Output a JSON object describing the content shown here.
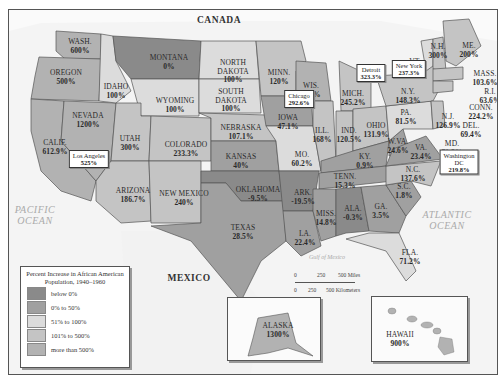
{
  "map": {
    "countries": {
      "canada": "CANADA",
      "mexico": "MEXICO"
    },
    "oceans": {
      "pacific": [
        "PACIFIC",
        "OCEAN"
      ],
      "atlantic": [
        "ATLANTIC",
        "OCEAN"
      ],
      "gulf": "Gulf of Mexico"
    },
    "legend": {
      "title": "Percent Increase in African American Population, 1940–1960",
      "categories": [
        {
          "label": "below 0%",
          "color": "#8a8a8a"
        },
        {
          "label": "0% to 50%",
          "color": "#a0a0a0"
        },
        {
          "label": "51% to 100%",
          "color": "#dcdcdc"
        },
        {
          "label": "101% to 500%",
          "color": "#c4c4c4"
        },
        {
          "label": "more than 500%",
          "color": "#b2b2b2"
        }
      ]
    },
    "scale": {
      "miles": [
        "0",
        "250",
        "500 Miles"
      ],
      "km": [
        "0",
        "250",
        "500 Kilometers"
      ]
    },
    "states": {
      "wash": {
        "name": "WASH.",
        "value": "600%"
      },
      "oregon": {
        "name": "OREGON",
        "value": "500%"
      },
      "calif": {
        "name": "CALIF.",
        "value": "612.9%"
      },
      "nevada": {
        "name": "NEVADA",
        "value": "1200%"
      },
      "idaho": {
        "name": "IDAHO",
        "value": "100%"
      },
      "montana": {
        "name": "MONTANA",
        "value": "0%"
      },
      "wyoming": {
        "name": "WYOMING",
        "value": "100%"
      },
      "utah": {
        "name": "UTAH",
        "value": "300%"
      },
      "colorado": {
        "name": "COLORADO",
        "value": "233.3%"
      },
      "arizona": {
        "name": "ARIZONA",
        "value": "186.7%"
      },
      "new_mexico": {
        "name": "NEW MEXICO",
        "value": "240%"
      },
      "north_dakota": {
        "name": "NORTH DAKOTA",
        "value": "100%"
      },
      "south_dakota": {
        "name": "SOUTH DAKOTA",
        "value": "100%"
      },
      "nebraska": {
        "name": "NEBRASKA",
        "value": "107.1%"
      },
      "kansas": {
        "name": "KANSAS",
        "value": "40%"
      },
      "oklahoma": {
        "name": "OKLAHOMA",
        "value": "-9.5%"
      },
      "texas": {
        "name": "TEXAS",
        "value": "28.5%"
      },
      "minn": {
        "name": "MINN.",
        "value": "120%"
      },
      "iowa": {
        "name": "IOWA",
        "value": "47.1%"
      },
      "mo": {
        "name": "MO.",
        "value": "60.2%"
      },
      "ark": {
        "name": "ARK.",
        "value": "-19.5%"
      },
      "la": {
        "name": "LA.",
        "value": "22.4%"
      },
      "wis": {
        "name": "WIS.",
        "value": "525%"
      },
      "ill": {
        "name": "ILL.",
        "value": "168%"
      },
      "mich": {
        "name": "MICH.",
        "value": "245.2%"
      },
      "ind": {
        "name": "IND.",
        "value": "120.5%"
      },
      "ohio": {
        "name": "OHIO",
        "value": "131.9%"
      },
      "ky": {
        "name": "KY.",
        "value": "0.9%"
      },
      "tenn": {
        "name": "TENN.",
        "value": "15.3%"
      },
      "miss": {
        "name": "MISS.",
        "value": "14.8%"
      },
      "ala": {
        "name": "ALA.",
        "value": "-0.3%"
      },
      "ga": {
        "name": "GA.",
        "value": "3.5%"
      },
      "fla": {
        "name": "FLA.",
        "value": "71.2%"
      },
      "sc": {
        "name": "S.C.",
        "value": "1.8%"
      },
      "nc": {
        "name": "N.C.",
        "value": "137.6%"
      },
      "va": {
        "name": "VA.",
        "value": "23.4%"
      },
      "wva": {
        "name": "W.VA.",
        "value": "24.6%"
      },
      "md": {
        "name": "MD.",
        "value": "71.5%"
      },
      "del": {
        "name": "DEL.",
        "value": "69.4%"
      },
      "pa": {
        "name": "PA.",
        "value": "81.5%"
      },
      "nj": {
        "name": "N.J.",
        "value": "126.9%"
      },
      "ny": {
        "name": "N.Y.",
        "value": "148.3%"
      },
      "conn": {
        "name": "CONN.",
        "value": "224.2%"
      },
      "ri": {
        "name": "R.I.",
        "value": "63.6%"
      },
      "mass": {
        "name": "MASS.",
        "value": "103.6%"
      },
      "vt": {
        "name": "VT.",
        "value": "100%"
      },
      "nh": {
        "name": "N.H.",
        "value": "300%"
      },
      "me": {
        "name": "ME.",
        "value": "200%"
      },
      "alaska": {
        "name": "ALASKA",
        "value": "1300%"
      },
      "hawaii": {
        "name": "HAWAII",
        "value": "900%"
      }
    },
    "cities": {
      "los_angeles": {
        "name": "Los Angeles",
        "value": "525%"
      },
      "chicago": {
        "name": "Chicago",
        "value": "292.6%"
      },
      "detroit": {
        "name": "Detroit",
        "value": "323.3%"
      },
      "new_york": {
        "name": "New York",
        "value": "237.3%"
      },
      "washington_dc": {
        "name": "Washington DC",
        "value": "219.8%"
      }
    }
  }
}
